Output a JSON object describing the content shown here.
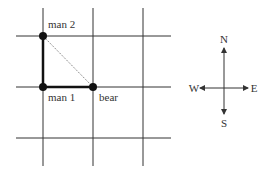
{
  "diagram": {
    "type": "grid-map",
    "grid": {
      "vertical_x": [
        43,
        93,
        143
      ],
      "horizontal_y": [
        36,
        87,
        138
      ],
      "x_extent": [
        16,
        171
      ],
      "y_extent": [
        8,
        166
      ],
      "color": "#333333"
    },
    "points": [
      {
        "id": "man2",
        "label": "man 2",
        "x": 43,
        "y": 36
      },
      {
        "id": "man1",
        "label": "man 1",
        "x": 43,
        "y": 87
      },
      {
        "id": "bear",
        "label": "bear",
        "x": 93,
        "y": 87
      }
    ],
    "paths": [
      {
        "from": "man2",
        "to": "man1",
        "style": "bold"
      },
      {
        "from": "man1",
        "to": "bear",
        "style": "bold"
      },
      {
        "from": "man2",
        "to": "bear",
        "style": "dotted"
      }
    ],
    "compass": {
      "center_x": 224,
      "center_y": 88,
      "north": "N",
      "south": "S",
      "east": "E",
      "west": "W"
    }
  }
}
